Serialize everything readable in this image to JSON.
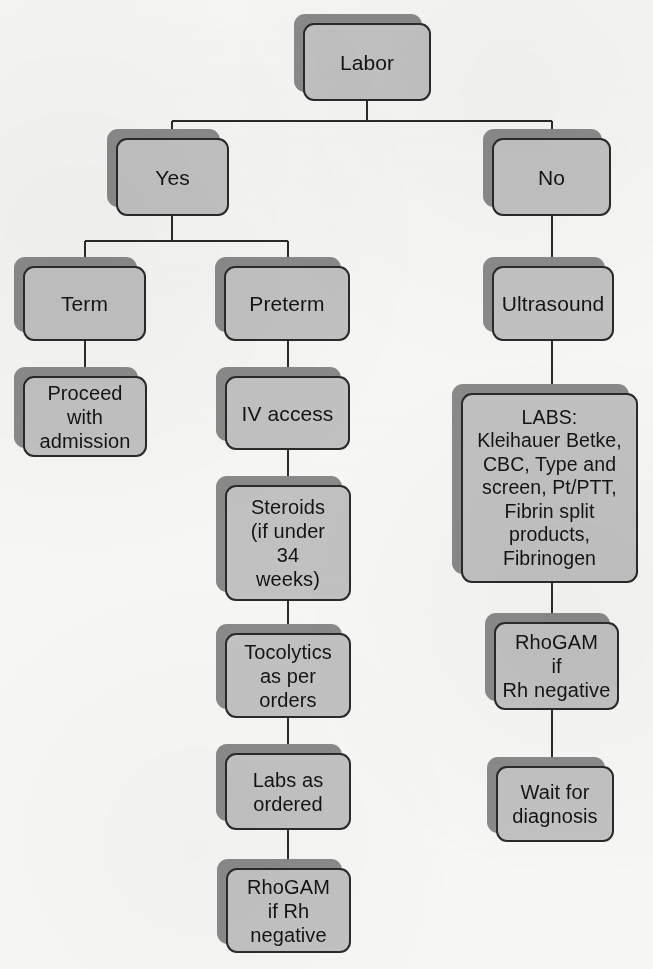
{
  "diagram": {
    "colors": {
      "box_fill": "#c2c2c2",
      "box_border": "#2a2a2a",
      "box_shadow": "#8a8a8a",
      "connector": "#2a2a2a",
      "page_background": "#f7f7f5",
      "text": "#141414"
    },
    "nodes": [
      {
        "id": "labor",
        "label": "Labor",
        "x": 303,
        "y": 23,
        "w": 128,
        "h": 78,
        "style": "small"
      },
      {
        "id": "yes",
        "label": "Yes",
        "x": 116,
        "y": 138,
        "w": 113,
        "h": 78,
        "style": "small"
      },
      {
        "id": "no",
        "label": "No",
        "x": 492,
        "y": 138,
        "w": 119,
        "h": 78,
        "style": "small"
      },
      {
        "id": "term",
        "label": "Term",
        "x": 23,
        "y": 266,
        "w": 123,
        "h": 75,
        "style": "small"
      },
      {
        "id": "preterm",
        "label": "Preterm",
        "x": 224,
        "y": 266,
        "w": 126,
        "h": 75,
        "style": "small"
      },
      {
        "id": "ultrasound",
        "label": "Ultrasound",
        "x": 492,
        "y": 266,
        "w": 122,
        "h": 75,
        "style": "small"
      },
      {
        "id": "proceed",
        "label": "Proceed\nwith\nadmission",
        "x": 23,
        "y": 376,
        "w": 124,
        "h": 81,
        "style": "multi"
      },
      {
        "id": "iv-access",
        "label": "IV access",
        "x": 225,
        "y": 376,
        "w": 125,
        "h": 74,
        "style": "small"
      },
      {
        "id": "labs-panel",
        "label": "LABS:\nKleihauer Betke,\nCBC, Type and\nscreen, Pt/PTT,\nFibrin split\nproducts,\nFibrinogen",
        "x": 461,
        "y": 393,
        "w": 177,
        "h": 190,
        "style": "labs"
      },
      {
        "id": "steroids",
        "label": "Steroids\n(if under\n34\nweeks)",
        "x": 225,
        "y": 485,
        "w": 126,
        "h": 116,
        "style": "multi"
      },
      {
        "id": "tocolytics",
        "label": "Tocolytics\nas per\norders",
        "x": 225,
        "y": 633,
        "w": 126,
        "h": 85,
        "style": "multi"
      },
      {
        "id": "rhogam-right",
        "label": "RhoGAM\nif\nRh negative",
        "x": 494,
        "y": 622,
        "w": 125,
        "h": 88,
        "style": "multi"
      },
      {
        "id": "labs-as-ordered",
        "label": "Labs as\nordered",
        "x": 225,
        "y": 753,
        "w": 126,
        "h": 77,
        "style": "multi"
      },
      {
        "id": "wait",
        "label": "Wait for\ndiagnosis",
        "x": 496,
        "y": 766,
        "w": 118,
        "h": 76,
        "style": "multi"
      },
      {
        "id": "rhogam-middle",
        "label": "RhoGAM\nif Rh\nnegative",
        "x": 226,
        "y": 868,
        "w": 125,
        "h": 85,
        "style": "multi"
      }
    ],
    "connectors": [
      {
        "id": "labor-to-split",
        "from": "labor",
        "to": "branch-bus-top",
        "kind": "vertical",
        "x1": 367,
        "y1": 101,
        "x2": 367,
        "y2": 121
      },
      {
        "id": "yes-no-bus",
        "from": "labor",
        "to": "yes-and-no",
        "kind": "horizontal",
        "x1": 172,
        "y1": 121,
        "x2": 552,
        "y2": 121
      },
      {
        "id": "bus-to-yes",
        "from": "yes-no-bus",
        "to": "yes",
        "kind": "vertical",
        "x1": 172,
        "y1": 121,
        "x2": 172,
        "y2": 138
      },
      {
        "id": "bus-to-no",
        "from": "yes-no-bus",
        "to": "no",
        "kind": "vertical",
        "x1": 552,
        "y1": 121,
        "x2": 552,
        "y2": 138
      },
      {
        "id": "yes-to-split",
        "from": "yes",
        "to": "term-bus",
        "kind": "vertical",
        "x1": 172,
        "y1": 216,
        "x2": 172,
        "y2": 241
      },
      {
        "id": "term-preterm-bus",
        "from": "yes",
        "to": "term-and-preterm",
        "kind": "horizontal",
        "x1": 85,
        "y1": 241,
        "x2": 288,
        "y2": 241
      },
      {
        "id": "bus-to-term",
        "from": "term-preterm-bus",
        "to": "term",
        "kind": "vertical",
        "x1": 85,
        "y1": 241,
        "x2": 85,
        "y2": 266
      },
      {
        "id": "bus-to-preterm",
        "from": "term-preterm-bus",
        "to": "preterm",
        "kind": "vertical",
        "x1": 288,
        "y1": 241,
        "x2": 288,
        "y2": 266
      },
      {
        "id": "term-to-proceed",
        "from": "term",
        "to": "proceed",
        "kind": "vertical",
        "x1": 85,
        "y1": 341,
        "x2": 85,
        "y2": 376
      },
      {
        "id": "preterm-to-iv",
        "from": "preterm",
        "to": "iv-access",
        "kind": "vertical",
        "x1": 288,
        "y1": 341,
        "x2": 288,
        "y2": 376
      },
      {
        "id": "iv-to-steroids",
        "from": "iv-access",
        "to": "steroids",
        "kind": "vertical",
        "x1": 288,
        "y1": 450,
        "x2": 288,
        "y2": 485
      },
      {
        "id": "steroids-to-tocolytics",
        "from": "steroids",
        "to": "tocolytics",
        "kind": "vertical",
        "x1": 288,
        "y1": 601,
        "x2": 288,
        "y2": 633
      },
      {
        "id": "tocolytics-to-labs",
        "from": "tocolytics",
        "to": "labs-as-ordered",
        "kind": "vertical",
        "x1": 288,
        "y1": 718,
        "x2": 288,
        "y2": 753
      },
      {
        "id": "labs-to-rhogam",
        "from": "labs-as-ordered",
        "to": "rhogam-middle",
        "kind": "vertical",
        "x1": 288,
        "y1": 830,
        "x2": 288,
        "y2": 868
      },
      {
        "id": "no-to-ultrasound",
        "from": "no",
        "to": "ultrasound",
        "kind": "vertical",
        "x1": 552,
        "y1": 216,
        "x2": 552,
        "y2": 266
      },
      {
        "id": "ultrasound-to-labs",
        "from": "ultrasound",
        "to": "labs-panel",
        "kind": "vertical",
        "x1": 552,
        "y1": 341,
        "x2": 552,
        "y2": 393
      },
      {
        "id": "labs-to-rhogam-right",
        "from": "labs-panel",
        "to": "rhogam-right",
        "kind": "vertical",
        "x1": 552,
        "y1": 583,
        "x2": 552,
        "y2": 622
      },
      {
        "id": "rhogam-to-wait",
        "from": "rhogam-right",
        "to": "wait",
        "kind": "vertical",
        "x1": 552,
        "y1": 710,
        "x2": 552,
        "y2": 766
      }
    ]
  }
}
